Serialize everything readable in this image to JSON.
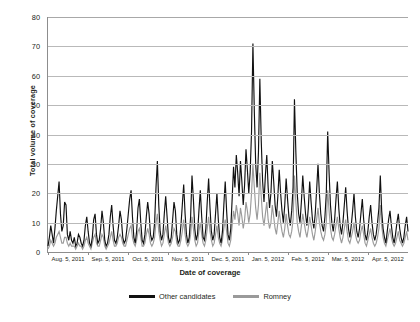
{
  "chart_data": {
    "type": "line",
    "title": "",
    "xlabel": "Date of coverage",
    "ylabel": "Total volume of coverage",
    "ylim": [
      0,
      80
    ],
    "yticks": [
      0,
      10,
      20,
      30,
      40,
      50,
      60,
      70,
      80
    ],
    "grid": "horizontal",
    "legend_position": "bottom-center",
    "x_tick_labels": [
      "Aug. 5, 2011",
      "Sep. 5, 2011",
      "Oct. 5, 2011",
      "Nov. 5, 2011",
      "Dec. 5, 2011",
      "Jan. 5, 2012",
      "Feb. 5, 2012",
      "Mar. 5, 2012",
      "Apr. 5, 2012"
    ],
    "x_range": [
      "Aug. 5, 2011",
      "Apr. 5, 2012"
    ],
    "x_unit": "day",
    "series": [
      {
        "name": "Other candidates",
        "color": "#111111",
        "values": [
          2,
          5,
          9,
          6,
          3,
          8,
          14,
          19,
          24,
          13,
          7,
          9,
          17,
          16,
          6,
          4,
          7,
          4,
          3,
          5,
          2,
          3,
          6,
          5,
          3,
          2,
          4,
          9,
          12,
          7,
          3,
          2,
          5,
          11,
          13,
          6,
          3,
          4,
          8,
          14,
          10,
          4,
          2,
          3,
          6,
          12,
          16,
          9,
          4,
          3,
          5,
          9,
          14,
          11,
          5,
          3,
          4,
          8,
          13,
          18,
          21,
          12,
          5,
          3,
          7,
          15,
          18,
          10,
          4,
          3,
          6,
          12,
          17,
          13,
          6,
          4,
          5,
          10,
          22,
          31,
          16,
          7,
          4,
          6,
          13,
          19,
          12,
          5,
          3,
          5,
          11,
          17,
          14,
          6,
          3,
          4,
          9,
          16,
          23,
          13,
          6,
          3,
          5,
          12,
          26,
          18,
          8,
          4,
          6,
          14,
          21,
          12,
          5,
          4,
          8,
          17,
          25,
          15,
          7,
          4,
          6,
          13,
          20,
          11,
          5,
          3,
          7,
          16,
          24,
          14,
          6,
          4,
          8,
          18,
          29,
          22,
          33,
          27,
          19,
          31,
          24,
          16,
          23,
          35,
          28,
          20,
          27,
          41,
          71,
          48,
          30,
          22,
          34,
          59,
          38,
          24,
          17,
          26,
          33,
          22,
          15,
          20,
          31,
          24,
          16,
          12,
          19,
          28,
          20,
          14,
          10,
          16,
          25,
          18,
          12,
          9,
          14,
          22,
          52,
          34,
          20,
          13,
          10,
          17,
          26,
          19,
          13,
          9,
          15,
          24,
          17,
          11,
          8,
          13,
          21,
          30,
          20,
          13,
          9,
          7,
          12,
          20,
          41,
          27,
          16,
          10,
          7,
          11,
          18,
          24,
          15,
          9,
          6,
          10,
          16,
          22,
          14,
          8,
          5,
          9,
          14,
          20,
          12,
          7,
          5,
          8,
          13,
          18,
          11,
          6,
          4,
          7,
          12,
          16,
          10,
          6,
          4,
          6,
          10,
          15,
          26,
          14,
          8,
          5,
          3,
          7,
          11,
          14,
          9,
          5,
          3,
          6,
          10,
          13,
          8,
          5,
          3,
          5,
          9,
          12,
          7
        ]
      },
      {
        "name": "Romney",
        "color": "#9a9a9a",
        "values": [
          1,
          2,
          4,
          3,
          2,
          3,
          5,
          6,
          7,
          5,
          3,
          3,
          5,
          5,
          3,
          2,
          3,
          2,
          2,
          2,
          1,
          2,
          3,
          2,
          2,
          1,
          2,
          4,
          5,
          3,
          2,
          1,
          3,
          5,
          6,
          3,
          2,
          2,
          4,
          6,
          5,
          2,
          1,
          2,
          3,
          5,
          7,
          4,
          2,
          2,
          3,
          5,
          6,
          5,
          3,
          2,
          2,
          4,
          6,
          8,
          9,
          5,
          3,
          2,
          4,
          7,
          8,
          5,
          2,
          2,
          3,
          6,
          8,
          6,
          3,
          2,
          3,
          5,
          10,
          13,
          7,
          4,
          2,
          3,
          6,
          9,
          6,
          3,
          2,
          3,
          5,
          8,
          7,
          3,
          2,
          2,
          4,
          7,
          11,
          6,
          3,
          2,
          3,
          6,
          12,
          8,
          4,
          2,
          3,
          7,
          10,
          6,
          3,
          2,
          4,
          8,
          12,
          7,
          4,
          2,
          3,
          6,
          9,
          5,
          3,
          2,
          4,
          8,
          11,
          7,
          3,
          2,
          4,
          9,
          14,
          11,
          16,
          13,
          9,
          15,
          12,
          8,
          11,
          17,
          14,
          10,
          13,
          20,
          30,
          22,
          15,
          11,
          16,
          27,
          19,
          12,
          9,
          13,
          17,
          11,
          8,
          10,
          16,
          12,
          8,
          6,
          10,
          14,
          10,
          7,
          5,
          8,
          13,
          9,
          6,
          5,
          7,
          11,
          26,
          17,
          10,
          7,
          5,
          9,
          13,
          10,
          7,
          5,
          8,
          12,
          9,
          6,
          4,
          7,
          11,
          15,
          10,
          7,
          5,
          4,
          6,
          10,
          21,
          14,
          8,
          5,
          4,
          6,
          9,
          12,
          8,
          5,
          3,
          5,
          8,
          11,
          7,
          4,
          3,
          5,
          7,
          10,
          6,
          4,
          3,
          4,
          7,
          9,
          6,
          3,
          2,
          4,
          6,
          8,
          5,
          3,
          2,
          3,
          5,
          8,
          16,
          9,
          5,
          3,
          2,
          4,
          6,
          8,
          5,
          3,
          2,
          3,
          5,
          7,
          4,
          3,
          2,
          3,
          5,
          7,
          4
        ]
      }
    ]
  }
}
